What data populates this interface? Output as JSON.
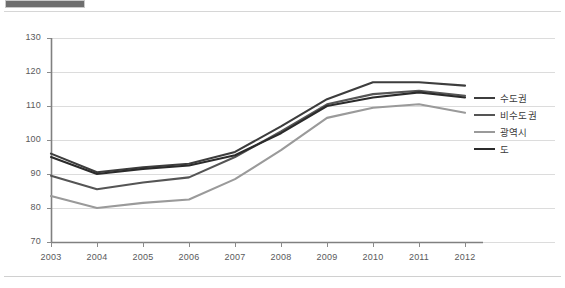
{
  "page": {
    "redaction_bar": "redacted-label",
    "background_color": "#ffffff"
  },
  "chart_data": {
    "type": "line",
    "title": "",
    "subtitle": "",
    "xlabel": "",
    "ylabel": "",
    "x": [
      2003,
      2004,
      2005,
      2006,
      2007,
      2008,
      2009,
      2010,
      2011,
      2012
    ],
    "categories": [
      "2003",
      "2004",
      "2005",
      "2006",
      "2007",
      "2008",
      "2009",
      "2010",
      "2011",
      "2012"
    ],
    "ylim": [
      70,
      130
    ],
    "yticks": [
      70,
      80,
      90,
      100,
      110,
      120,
      130
    ],
    "ytick_labels": [
      "70",
      "80",
      "90",
      "100",
      "110",
      "120",
      "130"
    ],
    "xlim": [
      2003,
      2012
    ],
    "grid": true,
    "grid_axis": "y",
    "legend_position": "right",
    "series": [
      {
        "name": "수도권",
        "color": "#3d3d3d",
        "width": 2.1,
        "values": [
          96.0,
          90.5,
          92.0,
          93.0,
          96.5,
          104.0,
          112.0,
          117.0,
          117.0,
          116.0
        ]
      },
      {
        "name": "비수도권",
        "color": "#555555",
        "width": 2.1,
        "values": [
          89.5,
          85.5,
          87.5,
          89.0,
          95.0,
          102.5,
          110.5,
          113.5,
          114.5,
          113.0
        ]
      },
      {
        "name": "광역시",
        "color": "#9a9a9a",
        "width": 2.1,
        "values": [
          83.5,
          80.0,
          81.5,
          82.5,
          88.5,
          97.0,
          106.5,
          109.5,
          110.5,
          108.0
        ]
      },
      {
        "name": "도",
        "color": "#2b2b2b",
        "width": 2.1,
        "values": [
          95.0,
          90.0,
          91.5,
          92.5,
          95.5,
          102.0,
          110.0,
          112.5,
          114.0,
          112.5
        ]
      }
    ]
  },
  "legend": {
    "items": [
      {
        "label": "수도권",
        "color": "#3d3d3d"
      },
      {
        "label": "비수도권",
        "color": "#555555"
      },
      {
        "label": "광역시",
        "color": "#9a9a9a"
      },
      {
        "label": "도",
        "color": "#2b2b2b"
      }
    ]
  }
}
